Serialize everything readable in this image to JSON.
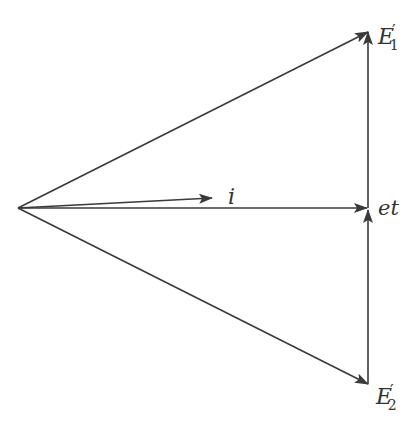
{
  "diagram": {
    "type": "phasor-diagram",
    "colors": {
      "line": "#3a3a3a",
      "label": "#333333",
      "background": "#ffffff"
    },
    "origin": {
      "x": 18,
      "y": 208
    },
    "vectors": [
      {
        "id": "E1p",
        "from": [
          18,
          208
        ],
        "to": [
          368,
          32
        ],
        "label": "E",
        "prime": "′",
        "sub": "1"
      },
      {
        "id": "E2p",
        "from": [
          18,
          208
        ],
        "to": [
          368,
          384
        ],
        "label": "E",
        "prime": "′",
        "sub": "2"
      },
      {
        "id": "et",
        "from": [
          18,
          208
        ],
        "to": [
          368,
          208
        ],
        "label": "et"
      },
      {
        "id": "i",
        "from": [
          18,
          208
        ],
        "to": [
          210,
          198
        ],
        "label": "i"
      }
    ],
    "labels": {
      "e1": {
        "main": "E",
        "prime": "′",
        "sub": "1"
      },
      "e2": {
        "main": "E",
        "prime": "′",
        "sub": "2"
      },
      "et": "et",
      "i": "i"
    }
  }
}
